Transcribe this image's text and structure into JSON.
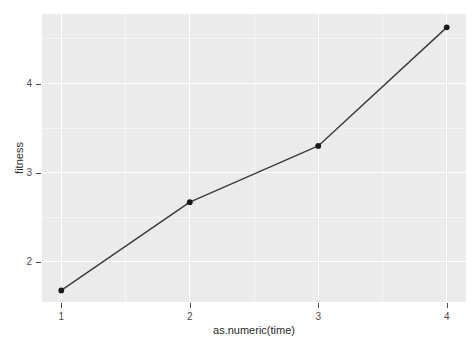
{
  "chart_data": {
    "type": "line",
    "title": "",
    "subtitle": "",
    "xlabel": "as.numeric(time)",
    "ylabel": "fitness",
    "x": [
      1,
      2,
      3,
      4
    ],
    "values": [
      1.68,
      2.67,
      3.3,
      4.63
    ],
    "series": [
      {
        "name": "fitness",
        "x": [
          1,
          2,
          3,
          4
        ],
        "values": [
          1.68,
          2.67,
          3.3,
          4.63
        ]
      }
    ],
    "xticks": [
      "1",
      "2",
      "3",
      "4"
    ],
    "xtick_values": [
      1,
      2,
      3,
      4
    ],
    "yticks": [
      "2",
      "3",
      "4"
    ],
    "ytick_values": [
      2,
      3,
      4
    ],
    "xlim": [
      0.85,
      4.15
    ],
    "ylim": [
      1.55,
      4.78
    ],
    "grid": true,
    "grid_major": true,
    "grid_minor": true,
    "legend": "none",
    "legend_position": "none",
    "marker": "point",
    "style": {
      "panel_background": "#ebebeb",
      "plot_background": "#ffffff",
      "grid_major_color": "#ffffff",
      "grid_minor_color": "#f5f5f5",
      "line_color": "#3a3a3a",
      "point_color": "#1a1a1a",
      "axis_text_color": "#4d4d4d",
      "axis_title_color": "#2b2b2b"
    }
  }
}
